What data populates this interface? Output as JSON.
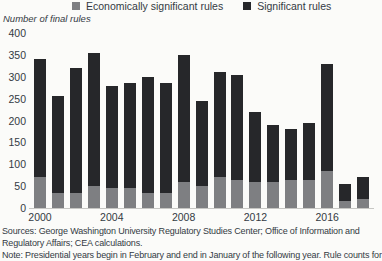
{
  "colors": {
    "economically_significant": "#7e7f82",
    "significant": "#26272a",
    "text": "#333a43",
    "axis_line": "#c7c7c4",
    "background": "#fbfbf9"
  },
  "legend": [
    {
      "label": "Economically significant rules",
      "color": "#7e7f82"
    },
    {
      "label": "Significant rules",
      "color": "#26272a"
    }
  ],
  "chart_data": {
    "type": "bar",
    "stacked": true,
    "title": "Number of final rules",
    "categories": [
      2000,
      2001,
      2002,
      2003,
      2004,
      2005,
      2006,
      2007,
      2008,
      2009,
      2010,
      2011,
      2012,
      2013,
      2014,
      2015,
      2016,
      2017,
      2018
    ],
    "x_tick_labels": [
      "2000",
      "2004",
      "2008",
      "2012",
      "2016"
    ],
    "y_ticks": [
      400,
      350,
      300,
      250,
      200,
      150,
      100,
      50,
      0
    ],
    "ylim": [
      0,
      400
    ],
    "grid": false,
    "legend_position": "top",
    "series": [
      {
        "name": "Economically significant rules",
        "color": "#7e7f82",
        "values": [
          70,
          35,
          35,
          50,
          45,
          45,
          35,
          35,
          60,
          50,
          70,
          65,
          60,
          60,
          65,
          65,
          85,
          15,
          20
        ]
      },
      {
        "name": "Significant rules",
        "color": "#26272a",
        "values": [
          270,
          220,
          285,
          305,
          235,
          240,
          265,
          250,
          290,
          195,
          240,
          240,
          160,
          130,
          115,
          130,
          245,
          40,
          50
        ]
      }
    ],
    "totals": [
      340,
      255,
      320,
      355,
      280,
      285,
      300,
      285,
      350,
      245,
      310,
      305,
      220,
      190,
      180,
      195,
      330,
      55,
      70
    ]
  },
  "footer": {
    "sources_line1": "Sources: George Washington University Regulatory Studies Center; Office of Information and",
    "sources_line2": "Regulatory Affairs; CEA calculations.",
    "note": "Note: Presidential years begin in February and end in January of the following year. Rule counts for"
  }
}
